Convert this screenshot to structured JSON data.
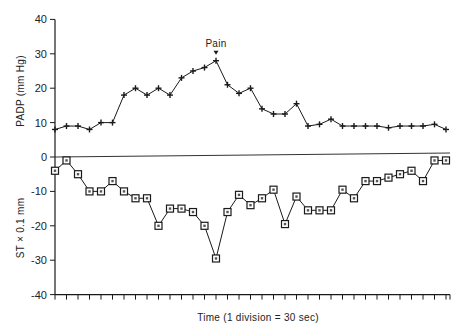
{
  "chart_data": {
    "type": "line",
    "title": "",
    "xlabel": "Time  (1 division = 30 sec)",
    "ylabel_upper": "PADP  (mm Hg)",
    "ylabel_lower": "ST × 0.1  mm",
    "ylim": [
      -40,
      40
    ],
    "yticks": [
      40,
      30,
      20,
      10,
      0,
      -10,
      -20,
      -30,
      -40
    ],
    "ytick_labels": [
      "40",
      "30",
      "20",
      "10",
      "0",
      "-10",
      "-20",
      "-30",
      "-40"
    ],
    "x_divisions": 35,
    "x": [
      0,
      1,
      2,
      3,
      4,
      5,
      6,
      7,
      8,
      9,
      10,
      11,
      12,
      13,
      14,
      15,
      16,
      17,
      18,
      19,
      20,
      21,
      22,
      23,
      24,
      25,
      26,
      27,
      28,
      29,
      30,
      31,
      32,
      33,
      34
    ],
    "grid": false,
    "zero_line": true,
    "series": [
      {
        "name": "PADP (mm Hg)",
        "marker": "plus",
        "values": [
          8,
          9,
          9,
          8,
          10,
          10,
          18,
          20,
          18,
          20,
          18,
          23,
          25,
          26,
          28,
          21,
          18.5,
          20,
          14,
          12.5,
          12.5,
          15.5,
          9,
          9.5,
          11,
          9,
          9,
          9,
          9,
          8.5,
          9,
          9,
          9,
          9.5,
          8
        ]
      },
      {
        "name": "ST × 0.1 mm",
        "marker": "square",
        "values": [
          -4,
          -1,
          -5,
          -10,
          -10,
          -7,
          -10,
          -12,
          -12,
          -20,
          -15,
          -15,
          -16,
          -20,
          -29.5,
          -16,
          -11,
          -14,
          -12,
          -9.5,
          -19.5,
          -11.5,
          -15.5,
          -15.5,
          -15.5,
          -9.5,
          -12,
          -7,
          -7,
          -6,
          -5,
          -4,
          -7,
          -1,
          -1
        ]
      }
    ],
    "annotations": [
      {
        "text": "Pain",
        "x_index": 14,
        "series": "PADP (mm Hg)",
        "arrow": "down"
      }
    ]
  }
}
